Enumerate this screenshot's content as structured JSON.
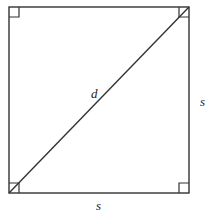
{
  "diagram": {
    "title": "",
    "shape": "square",
    "square": {
      "x": 9,
      "y": 7,
      "size_w": 180,
      "size_h": 186
    },
    "right_angle_marker_size": 10,
    "stroke_color": "#333333",
    "labels": {
      "diagonal": "d",
      "right_side": "s",
      "bottom_side": "s"
    },
    "right_angle_corners": [
      "top-left",
      "top-right",
      "bottom-left",
      "bottom-right"
    ]
  }
}
